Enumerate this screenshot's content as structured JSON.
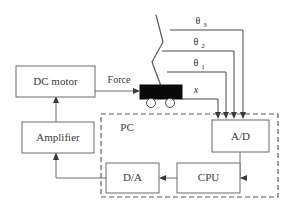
{
  "figure": {
    "type": "block-diagram",
    "background": "#ffffff",
    "line_color": "#6b6b6b",
    "cart_color": "#0a0a0a"
  },
  "blocks": [
    {
      "id": "dc_motor",
      "label": "DC motor",
      "x": 16,
      "y": 66,
      "w": 79,
      "h": 31
    },
    {
      "id": "amplifier",
      "label": "Amplifier",
      "x": 22,
      "y": 122,
      "w": 72,
      "h": 31
    },
    {
      "id": "ad",
      "label": "A/D",
      "x": 212,
      "y": 120,
      "w": 57,
      "h": 32
    },
    {
      "id": "da",
      "label": "D/A",
      "x": 106,
      "y": 163,
      "w": 53,
      "h": 30
    },
    {
      "id": "cpu",
      "label": "CPU",
      "x": 177,
      "y": 163,
      "w": 63,
      "h": 30
    }
  ],
  "enclosure": {
    "label": "PC",
    "x": 101,
    "y": 114,
    "w": 177,
    "h": 83,
    "label_x": 127,
    "label_y": 128
  },
  "edge_labels": [
    {
      "id": "force",
      "label": "Force",
      "x": 119,
      "y": 83
    }
  ],
  "signals": [
    {
      "id": "x",
      "symbol": "x",
      "subscript": "",
      "italic": true,
      "label_x": 196,
      "label_y": 93,
      "wire_x": 218
    },
    {
      "id": "theta1",
      "symbol": "θ",
      "subscript": "1",
      "italic": false,
      "label_x": 198,
      "label_y": 66,
      "wire_x": 226
    },
    {
      "id": "theta2",
      "symbol": "θ",
      "subscript": "2",
      "italic": false,
      "label_x": 198,
      "label_y": 45,
      "wire_x": 234
    },
    {
      "id": "theta3",
      "symbol": "θ",
      "subscript": "3",
      "italic": false,
      "label_x": 200,
      "label_y": 24,
      "wire_x": 243
    }
  ],
  "cart": {
    "body": {
      "x": 140,
      "y": 85,
      "w": 42,
      "h": 14
    },
    "wheels": [
      {
        "cx": 151,
        "cy": 103,
        "r": 4.5
      },
      {
        "cx": 170,
        "cy": 103,
        "r": 4.5
      }
    ]
  },
  "pendulum": {
    "joints": [
      {
        "x": 161,
        "y": 86
      },
      {
        "x": 152,
        "y": 62
      },
      {
        "x": 163,
        "y": 42
      },
      {
        "x": 156,
        "y": 15
      }
    ]
  }
}
